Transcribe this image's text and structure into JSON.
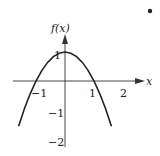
{
  "chart_data": {
    "type": "line",
    "title": "",
    "xlabel": "x",
    "ylabel": "f(x)",
    "x_ticks": [
      "-1",
      "1",
      "2"
    ],
    "y_ticks": [
      "1",
      "-1",
      "-2"
    ],
    "xlim": [
      -1.7,
      2.5
    ],
    "ylim": [
      -2.2,
      1.7
    ],
    "grid": false,
    "series": [
      {
        "name": "f(x)",
        "x": [
          -1.6,
          -1.4,
          -1.2,
          -1.0,
          -0.8,
          -0.6,
          -0.4,
          -0.2,
          0.0,
          0.2,
          0.4,
          0.6,
          0.8,
          1.0,
          1.2,
          1.4,
          1.6
        ],
        "values": [
          -1.56,
          -0.96,
          -0.44,
          0.0,
          0.36,
          0.64,
          0.84,
          0.96,
          1.0,
          0.96,
          0.84,
          0.64,
          0.36,
          0.0,
          -0.44,
          -0.96,
          -1.56
        ]
      }
    ]
  },
  "labels": {
    "y_axis": "f(x)",
    "x_axis": "x",
    "tick_x_neg1": "−1",
    "tick_x_1": "1",
    "tick_x_2": "2",
    "tick_y_1": "1",
    "tick_y_neg1": "−1",
    "tick_y_neg2": "−2"
  }
}
